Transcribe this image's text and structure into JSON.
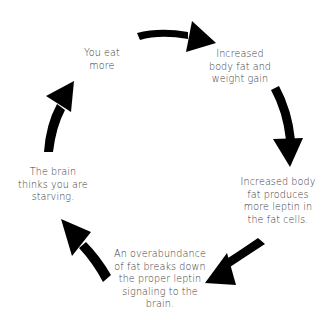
{
  "diagram": {
    "type": "cycle",
    "arrow_color": "#000000",
    "text_color": "#3a3a3a",
    "nodes": [
      {
        "id": "eat-more",
        "lines": [
          "You eat",
          "more"
        ]
      },
      {
        "id": "body-fat-gain",
        "lines": [
          "Increased",
          "body fat and",
          "weight gain"
        ]
      },
      {
        "id": "more-leptin",
        "lines": [
          "Increased body",
          "fat produces",
          "more leptin in",
          "the fat cells."
        ]
      },
      {
        "id": "signaling-breakdown",
        "lines": [
          "An overabundance",
          "of fat breaks down",
          "the proper leptin",
          "signaling to the",
          "brain."
        ]
      },
      {
        "id": "brain-starving",
        "lines": [
          "The brain",
          "thinks you are",
          "starving."
        ]
      }
    ],
    "edges": [
      {
        "from": "eat-more",
        "to": "body-fat-gain"
      },
      {
        "from": "body-fat-gain",
        "to": "more-leptin"
      },
      {
        "from": "more-leptin",
        "to": "signaling-breakdown"
      },
      {
        "from": "signaling-breakdown",
        "to": "brain-starving"
      },
      {
        "from": "brain-starving",
        "to": "eat-more"
      }
    ]
  }
}
